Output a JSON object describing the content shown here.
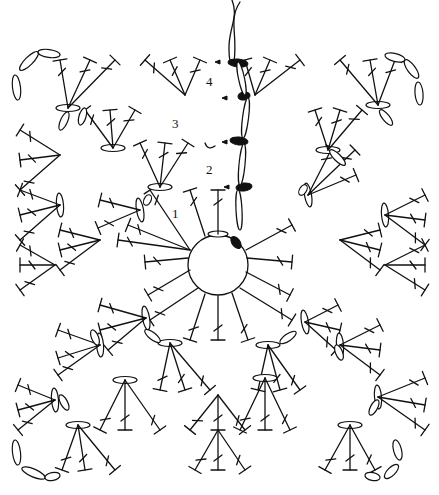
{
  "diagram": {
    "type": "crochet-chart",
    "round_labels": [
      {
        "text": "1",
        "x": 172,
        "y": 218
      },
      {
        "text": "2",
        "x": 206,
        "y": 174
      },
      {
        "text": "3",
        "x": 172,
        "y": 128
      },
      {
        "text": "4",
        "x": 206,
        "y": 86
      }
    ],
    "center_ring": {
      "cx": 218,
      "cy": 265,
      "r": 30
    },
    "colors": {
      "ink": "#111111",
      "background": "#ffffff"
    }
  }
}
